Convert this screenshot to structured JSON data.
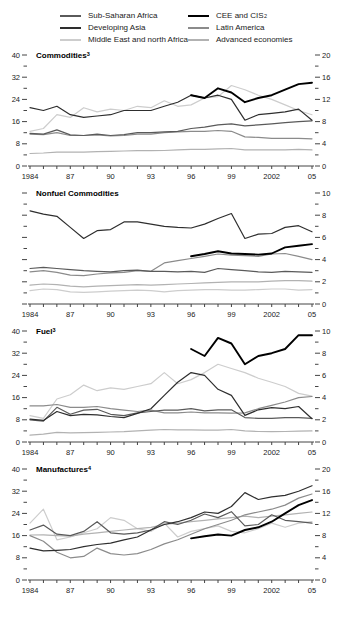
{
  "legend": {
    "items": [
      {
        "label": "Sub-Saharan Africa",
        "sup": "",
        "color": "#5a5a5a",
        "thick": false
      },
      {
        "label": "Developing Asia",
        "sup": "",
        "color": "#2e2e2e",
        "thick": false
      },
      {
        "label": "Middle East and north Africa",
        "sup": "",
        "color": "#cdcdcd",
        "thick": false
      },
      {
        "label": "CEE and CIS",
        "sup": "2",
        "color": "#000000",
        "thick": true
      },
      {
        "label": "Latin America",
        "sup": "",
        "color": "#8b8b8b",
        "thick": false
      },
      {
        "label": "Advanced economies",
        "sup": "",
        "color": "#b2b2b2",
        "thick": false
      }
    ]
  },
  "chart_data": [
    {
      "type": "line",
      "title": "Commodities",
      "title_sup": "3",
      "x": [
        1984,
        1985,
        1986,
        1987,
        1988,
        1989,
        1990,
        1991,
        1992,
        1993,
        1994,
        1995,
        1996,
        1997,
        1998,
        1999,
        2000,
        2001,
        2002,
        2003,
        2004,
        2005
      ],
      "x_tick_labels": [
        "1984",
        "87",
        "90",
        "93",
        "96",
        "99",
        "2002",
        "05"
      ],
      "left_axis": {
        "min": 0,
        "max": 40,
        "major_step": 8,
        "labeled": true
      },
      "right_axis": {
        "min": 0,
        "max": 20,
        "major_step": 4,
        "labeled": true
      },
      "series_scale": "left",
      "series": [
        {
          "name": "Middle East and north Africa",
          "values": [
            12.5,
            13.5,
            18.5,
            17.5,
            21,
            19.5,
            20.5,
            20,
            21.5,
            21,
            23.5,
            21.5,
            22,
            24.5,
            25,
            29,
            27.5,
            25.5,
            24,
            22,
            20,
            18.5
          ]
        },
        {
          "name": "Advanced economies",
          "values": [
            4.5,
            4.7,
            5,
            5,
            5,
            5.2,
            5.3,
            5.4,
            5.5,
            5.5,
            5.6,
            5.8,
            6,
            6,
            6.2,
            6.3,
            5.8,
            5.8,
            5.8,
            5.8,
            6,
            5.8
          ]
        },
        {
          "name": "Latin America",
          "values": [
            11.5,
            11.3,
            12,
            11,
            11,
            11.2,
            10.8,
            11,
            11.5,
            11.5,
            12,
            12.3,
            12.5,
            12.5,
            12.8,
            12.5,
            10.5,
            10.3,
            10,
            10,
            10,
            9.8
          ]
        },
        {
          "name": "Sub-Saharan Africa",
          "values": [
            11.8,
            11.5,
            13,
            11.2,
            11,
            11.5,
            11,
            11.3,
            12,
            12,
            12.3,
            12.5,
            13.5,
            14,
            14.8,
            15.2,
            14.5,
            14.8,
            15.2,
            15.6,
            16,
            16.3
          ]
        },
        {
          "name": "Developing Asia",
          "values": [
            21,
            20,
            21.5,
            18.5,
            17.5,
            18,
            18.5,
            20,
            20,
            20,
            21.5,
            23,
            25.5,
            24.5,
            25.5,
            24,
            16.5,
            18.5,
            19,
            19.5,
            20.5,
            16.5
          ]
        },
        {
          "name": "CEE and CIS",
          "values": [
            null,
            null,
            null,
            null,
            null,
            null,
            null,
            null,
            null,
            null,
            null,
            null,
            25.5,
            24.5,
            28,
            26.5,
            23,
            24.5,
            25.5,
            27.5,
            29.5,
            30
          ]
        }
      ]
    },
    {
      "type": "line",
      "title": "Nonfuel Commodities",
      "title_sup": "",
      "x": [
        1984,
        1985,
        1986,
        1987,
        1988,
        1989,
        1990,
        1991,
        1992,
        1993,
        1994,
        1995,
        1996,
        1997,
        1998,
        1999,
        2000,
        2001,
        2002,
        2003,
        2004,
        2005
      ],
      "x_tick_labels": [
        "1984",
        "87",
        "90",
        "93",
        "96",
        "99",
        "2002",
        "05"
      ],
      "left_axis": {
        "min": 0,
        "max": 40,
        "major_step": 8,
        "labeled": false
      },
      "right_axis": {
        "min": 0,
        "max": 10,
        "major_step": 2,
        "labeled": true
      },
      "series_scale": "right",
      "series": [
        {
          "name": "Middle East and north Africa",
          "values": [
            1.2,
            1.35,
            1.3,
            1.1,
            1.05,
            1.1,
            1.15,
            1.2,
            1.25,
            1.2,
            1.1,
            1.2,
            1.25,
            1.3,
            1.3,
            1.25,
            1.25,
            1.3,
            1.35,
            1.35,
            1.25,
            1.3
          ]
        },
        {
          "name": "Advanced economies",
          "values": [
            1.7,
            1.8,
            1.75,
            1.6,
            1.55,
            1.6,
            1.65,
            1.7,
            1.75,
            1.7,
            1.75,
            1.8,
            1.85,
            1.9,
            1.95,
            2,
            2,
            2,
            2.05,
            2.1,
            2.1,
            2.05
          ]
        },
        {
          "name": "Latin America",
          "values": [
            2.9,
            3,
            2.85,
            2.6,
            2.55,
            2.7,
            2.8,
            2.85,
            3,
            2.95,
            3.7,
            3.9,
            4.1,
            4.3,
            4.5,
            4.4,
            4.35,
            4.3,
            4.5,
            4.55,
            4.3,
            4
          ]
        },
        {
          "name": "Sub-Saharan Africa",
          "values": [
            3.2,
            3.3,
            3.2,
            3.1,
            3,
            2.95,
            2.9,
            3,
            3.05,
            2.95,
            2.95,
            2.9,
            2.95,
            2.85,
            3.2,
            3.1,
            3,
            2.9,
            2.85,
            2.95,
            2.9,
            2.85
          ]
        },
        {
          "name": "Developing Asia",
          "values": [
            8.4,
            8.1,
            7.9,
            6.9,
            5.9,
            6.6,
            6.7,
            7.4,
            7.4,
            7.2,
            7,
            6.9,
            6.85,
            7.2,
            7.7,
            8.15,
            5.9,
            6.3,
            6.35,
            6.9,
            7.05,
            6.5
          ]
        },
        {
          "name": "CEE and CIS",
          "values": [
            null,
            null,
            null,
            null,
            null,
            null,
            null,
            null,
            null,
            null,
            null,
            null,
            4.3,
            4.5,
            4.75,
            4.55,
            4.5,
            4.45,
            4.55,
            5.1,
            5.25,
            5.4
          ]
        }
      ]
    },
    {
      "type": "line",
      "title": "Fuel",
      "title_sup": "3",
      "x": [
        1984,
        1985,
        1986,
        1987,
        1988,
        1989,
        1990,
        1991,
        1992,
        1993,
        1994,
        1995,
        1996,
        1997,
        1998,
        1999,
        2000,
        2001,
        2002,
        2003,
        2004,
        2005
      ],
      "x_tick_labels": [
        "1984",
        "87",
        "90",
        "93",
        "96",
        "99",
        "2002",
        "05"
      ],
      "left_axis": {
        "min": 0,
        "max": 40,
        "major_step": 8,
        "labeled": true
      },
      "right_axis": {
        "min": 0,
        "max": 10,
        "major_step": 2,
        "labeled": true
      },
      "series_scale": "left",
      "series": [
        {
          "name": "Middle East and north Africa",
          "values": [
            9.5,
            8.5,
            15.5,
            17,
            20.5,
            18.5,
            19.5,
            19,
            20,
            21,
            25,
            21,
            22.5,
            25,
            28,
            26.5,
            25,
            23,
            21.5,
            20,
            17.5,
            16.5
          ]
        },
        {
          "name": "Advanced economies",
          "values": [
            2.5,
            2.8,
            3.5,
            3.3,
            3.4,
            3.5,
            3.6,
            3.7,
            4,
            4.3,
            4.5,
            4.4,
            4.4,
            4.3,
            4.3,
            4.5,
            4,
            3.8,
            3.7,
            3.8,
            3.9,
            4
          ]
        },
        {
          "name": "Latin America",
          "values": [
            13,
            13,
            13.5,
            12.5,
            12.5,
            12.8,
            12,
            11.5,
            11,
            11.5,
            10.5,
            10.5,
            10.8,
            10.5,
            10.5,
            10.4,
            10.5,
            12,
            13.2,
            14.4,
            16,
            16.4
          ]
        },
        {
          "name": "Sub-Saharan Africa",
          "values": [
            8,
            7.5,
            12.5,
            10,
            11.5,
            11.8,
            10,
            9.5,
            10.5,
            11,
            11.5,
            11.5,
            12,
            11.2,
            11.6,
            11.6,
            8.8,
            8.5,
            8.5,
            8.8,
            8.8,
            8.5
          ]
        },
        {
          "name": "Developing Asia",
          "values": [
            8.2,
            7.8,
            11,
            9.5,
            10,
            9.8,
            9.2,
            8.8,
            10.3,
            12,
            16.8,
            21.5,
            25,
            24,
            19,
            16.8,
            9.6,
            11.6,
            12.4,
            12,
            12.8,
            8.4
          ]
        },
        {
          "name": "CEE and CIS",
          "values": [
            null,
            null,
            null,
            null,
            null,
            null,
            null,
            null,
            null,
            null,
            null,
            null,
            33.5,
            31,
            37.5,
            35.5,
            28,
            31,
            32,
            33.5,
            38.5,
            38.5
          ]
        }
      ]
    },
    {
      "type": "line",
      "title": "Manufactures",
      "title_sup": "4",
      "x": [
        1984,
        1985,
        1986,
        1987,
        1988,
        1989,
        1990,
        1991,
        1992,
        1993,
        1994,
        1995,
        1996,
        1997,
        1998,
        1999,
        2000,
        2001,
        2002,
        2003,
        2004,
        2005
      ],
      "x_tick_labels": [
        "1984",
        "87",
        "90",
        "93",
        "96",
        "99",
        "2002",
        "05"
      ],
      "left_axis": {
        "min": 0,
        "max": 40,
        "major_step": 8,
        "labeled": true
      },
      "right_axis": {
        "min": 0,
        "max": 20,
        "major_step": 4,
        "labeled": true
      },
      "series_scale": "left",
      "series": [
        {
          "name": "Middle East and north Africa",
          "values": [
            20.5,
            25.5,
            14.5,
            15.5,
            17,
            18.5,
            22.5,
            21.5,
            18.5,
            17.5,
            20.5,
            15.5,
            17.5,
            18.5,
            19.5,
            17.5,
            17,
            18.5,
            20.5,
            19,
            20.5,
            21
          ]
        },
        {
          "name": "Advanced economies",
          "values": [
            16.2,
            16.3,
            16,
            15.8,
            16.5,
            17,
            17.5,
            18,
            18.5,
            19,
            20,
            20.5,
            21,
            21.5,
            22,
            22.5,
            23,
            22.5,
            23,
            23.5,
            24,
            24.5
          ]
        },
        {
          "name": "Latin America",
          "values": [
            16,
            14,
            10,
            8,
            8.5,
            11.5,
            9.5,
            9,
            9.5,
            11,
            13,
            14.5,
            16.5,
            18.5,
            20,
            21.5,
            23.5,
            24.5,
            25.5,
            27,
            29.5,
            31
          ]
        },
        {
          "name": "Sub-Saharan Africa",
          "values": [
            18,
            19.8,
            16.5,
            16,
            17.5,
            21,
            17,
            16.5,
            17,
            18,
            21,
            20,
            21.5,
            23.8,
            22.5,
            24.6,
            19.5,
            20,
            23.5,
            21.5,
            21,
            20.5
          ]
        },
        {
          "name": "Developing Asia",
          "values": [
            11.5,
            10.5,
            10.7,
            11,
            12,
            12.8,
            13.3,
            14.5,
            15.5,
            18,
            20,
            21,
            22.5,
            24.5,
            24,
            26.5,
            31.5,
            29,
            30,
            30.5,
            32,
            34
          ]
        },
        {
          "name": "CEE and CIS",
          "values": [
            null,
            null,
            null,
            null,
            null,
            null,
            null,
            null,
            null,
            null,
            null,
            null,
            15,
            15.8,
            16.4,
            16,
            18,
            19,
            21,
            24,
            27,
            28.8
          ]
        }
      ]
    }
  ]
}
